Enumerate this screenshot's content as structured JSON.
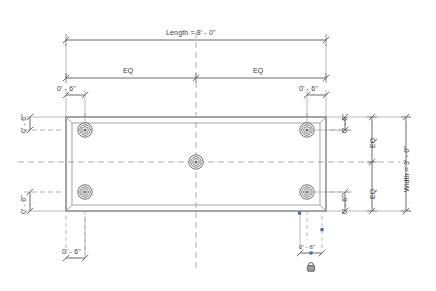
{
  "drawing": {
    "title_dimension": "Length = 8' - 0\"",
    "width_dimension": "Width = 3' - 0\"",
    "eq_label": "EQ",
    "offset_label": "0' - 6\"",
    "labels": {
      "length_top": "Length = 8' - 0\"",
      "eq_top_left": "EQ",
      "eq_top_right": "EQ",
      "eq_right_upper": "EQ",
      "eq_right_lower": "EQ",
      "width_right": "Width = 3' - 0\"",
      "offset_top_left": "0' - 6\"",
      "offset_top_right": "0' - 6\"",
      "offset_left_upper": "0' - 6\"",
      "offset_left_lower": "0' - 6\"",
      "offset_right_upper": "0' - 6\"",
      "offset_right_lower": "0' - 6\"",
      "offset_bottom_left": "0' - 6\"",
      "offset_bottom_right": "0' - 6\""
    },
    "icons": {
      "lock": "padlock-locked-icon",
      "grip": "drag-grip-square"
    },
    "colors": {
      "line": "#5a5a5a",
      "line_light": "#8d8d8d",
      "dashed": "#9a9a9a",
      "text": "#3c3c3c",
      "grip": "#4a6fa5",
      "background": "#ffffff"
    },
    "geometry": {
      "slab_outer": {
        "x": 66,
        "y": 117,
        "width": 260,
        "height": 94
      },
      "slab_inner": {
        "x": 72,
        "y": 123,
        "width": 248,
        "height": 82
      },
      "bolts": [
        {
          "cx": 85,
          "cy": 130,
          "name": "anchor-bolt-top-left"
        },
        {
          "cx": 307,
          "cy": 130,
          "name": "anchor-bolt-top-right"
        },
        {
          "cx": 85,
          "cy": 192,
          "name": "anchor-bolt-bottom-left"
        },
        {
          "cx": 307,
          "cy": 192,
          "name": "anchor-bolt-bottom-right"
        },
        {
          "cx": 196,
          "cy": 162,
          "name": "anchor-bolt-center"
        }
      ]
    }
  }
}
